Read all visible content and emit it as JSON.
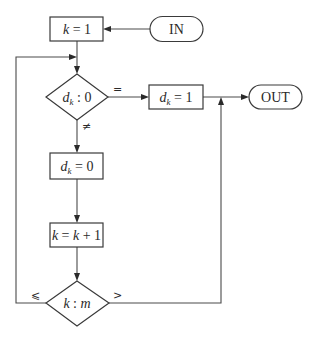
{
  "diagram": {
    "type": "flowchart",
    "nodes": {
      "in": {
        "kind": "terminator",
        "label": "IN"
      },
      "init_k": {
        "kind": "process",
        "label_var": "k",
        "label_rest": " = 1"
      },
      "check_d": {
        "kind": "decision",
        "label_var": "d",
        "label_sub": "k",
        "label_rest": " : 0"
      },
      "set_d1": {
        "kind": "process",
        "label_var": "d",
        "label_sub": "k",
        "label_rest": " = 1"
      },
      "out": {
        "kind": "terminator",
        "label": "OUT"
      },
      "set_d0": {
        "kind": "process",
        "label_var": "d",
        "label_sub": "k",
        "label_rest": " = 0"
      },
      "inc_k": {
        "kind": "process",
        "label_var": "k",
        "label_rest": " = ",
        "label_var2": "k",
        "label_rest2": " + 1"
      },
      "check_k": {
        "kind": "decision",
        "label_var": "k",
        "label_rest": " : ",
        "label_var2": "m"
      }
    },
    "edge_labels": {
      "eq": "=",
      "neq": "≠",
      "le": "⩽",
      "gt": ">"
    },
    "edges": [
      {
        "from": "in",
        "to": "init_k"
      },
      {
        "from": "init_k",
        "to": "check_d"
      },
      {
        "from": "check_d",
        "to": "set_d1",
        "label": "="
      },
      {
        "from": "check_d",
        "to": "set_d0",
        "label": "≠"
      },
      {
        "from": "set_d1",
        "to": "out"
      },
      {
        "from": "set_d0",
        "to": "inc_k"
      },
      {
        "from": "inc_k",
        "to": "check_k"
      },
      {
        "from": "check_k",
        "to": "check_d",
        "label": "⩽"
      },
      {
        "from": "check_k",
        "to": "out",
        "label": ">"
      }
    ]
  }
}
